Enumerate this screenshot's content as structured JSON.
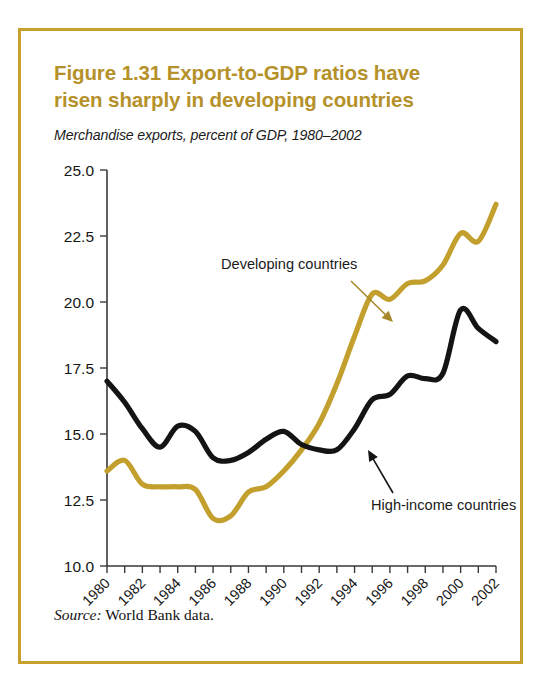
{
  "figure": {
    "title": "Figure 1.31  Export-to-GDP ratios have risen sharply in developing countries",
    "subtitle": "Merchandise exports, percent of GDP, 1980–2002",
    "source_label": "Source:",
    "source_text": " World Bank data.",
    "border_color": "#c8a02c",
    "title_color": "#b5912a"
  },
  "chart_data": {
    "type": "line",
    "title": "Figure 1.31  Export-to-GDP ratios have risen sharply in developing countries",
    "subtitle": "Merchandise exports, percent of GDP, 1980–2002",
    "xlabel": "",
    "ylabel": "",
    "grid": false,
    "legend_position": "inline-annotations",
    "xlim": [
      1980,
      2002
    ],
    "ylim": [
      10.0,
      25.0
    ],
    "ytick_labels": [
      "25.0",
      "22.5",
      "20.0",
      "17.5",
      "15.0",
      "12.5",
      "10.0"
    ],
    "ytick_values": [
      25.0,
      22.5,
      20.0,
      17.5,
      15.0,
      12.5,
      10.0
    ],
    "xtick_labels": [
      "1980",
      "1982",
      "1984",
      "1986",
      "1988",
      "1990",
      "1992",
      "1994",
      "1996",
      "1998",
      "2000",
      "2002"
    ],
    "xtick_values": [
      1980,
      1982,
      1984,
      1986,
      1988,
      1990,
      1992,
      1994,
      1996,
      1998,
      2000,
      2002
    ],
    "x": [
      1980,
      1981,
      1982,
      1983,
      1984,
      1985,
      1986,
      1987,
      1988,
      1989,
      1990,
      1991,
      1992,
      1993,
      1994,
      1995,
      1996,
      1997,
      1998,
      1999,
      2000,
      2001,
      2002
    ],
    "series": [
      {
        "name": "Developing countries",
        "color": "#c3a02e",
        "values": [
          13.6,
          14.0,
          13.1,
          13.0,
          13.0,
          12.9,
          11.8,
          11.9,
          12.8,
          13.0,
          13.6,
          14.4,
          15.4,
          16.9,
          18.7,
          20.3,
          20.1,
          20.7,
          20.8,
          21.4,
          22.6,
          22.3,
          23.7
        ]
      },
      {
        "name": "High-income countries",
        "color": "#141414",
        "values": [
          17.0,
          16.2,
          15.2,
          14.5,
          15.3,
          15.1,
          14.1,
          14.0,
          14.3,
          14.8,
          15.1,
          14.6,
          14.4,
          14.4,
          15.2,
          16.3,
          16.5,
          17.2,
          17.1,
          17.3,
          19.7,
          19.0,
          18.5
        ]
      }
    ],
    "annotations": [
      {
        "text": "Developing countries",
        "target_series": "Developing countries",
        "arrow_color": "#a8882a"
      },
      {
        "text": "High-income countries",
        "target_series": "High-income countries",
        "arrow_color": "#141414"
      }
    ],
    "source": "Source: World Bank data."
  }
}
